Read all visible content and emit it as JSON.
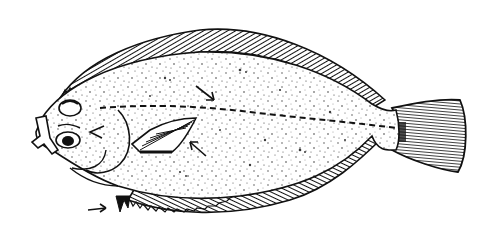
{
  "illustration": {
    "subject": "Flatfish (flounder) line drawing",
    "style": "black ink stipple illustration on white",
    "colors": {
      "ink": "#111111",
      "background": "#ffffff",
      "stipple": "#3a3a3a"
    },
    "parts": [
      "head",
      "eye-upper",
      "eye-lower",
      "mouth",
      "pectoral-fin",
      "dorsal-fin",
      "anal-fin",
      "pelvic-fin",
      "caudal-fin",
      "lateral-line",
      "stippled-body"
    ],
    "annotation_arrows": [
      {
        "name": "arrow-upper-body",
        "x": 210,
        "y": 92
      },
      {
        "name": "arrow-below-pectoral",
        "x": 192,
        "y": 148
      },
      {
        "name": "arrow-head",
        "x": 92,
        "y": 132
      },
      {
        "name": "arrow-pelvic",
        "x": 95,
        "y": 210
      }
    ]
  }
}
